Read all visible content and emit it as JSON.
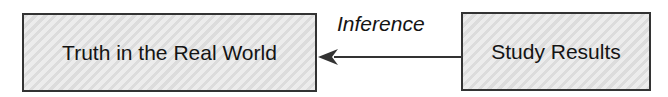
{
  "diagram": {
    "nodes": [
      {
        "id": "truth",
        "label": "Truth in the Real World"
      },
      {
        "id": "results",
        "label": "Study Results"
      }
    ],
    "edges": [
      {
        "from": "results",
        "to": "truth",
        "label": "Inference"
      }
    ],
    "colors": {
      "box_fill": "#e4e4e4",
      "border": "#333333",
      "text": "#141414",
      "arrow": "#333333"
    }
  }
}
